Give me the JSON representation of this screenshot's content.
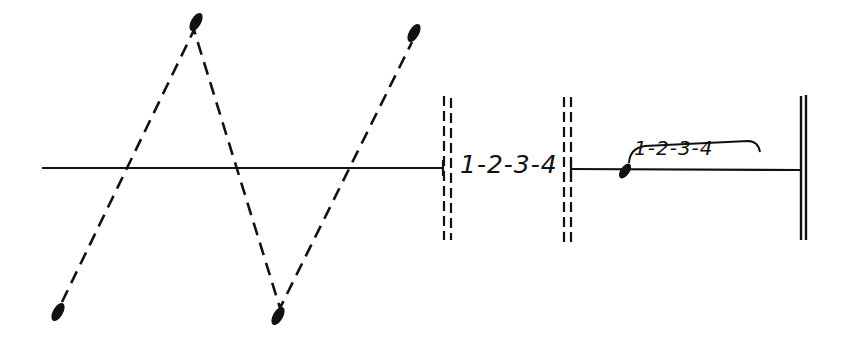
{
  "diagram": {
    "type": "graphic music notation",
    "ink_color": "#111111",
    "background": "#ffffff",
    "staff_line": {
      "y": 168
    },
    "zigzag_notes": [
      {
        "x": 58,
        "y": 310
      },
      {
        "x": 196,
        "y": 24
      },
      {
        "x": 278,
        "y": 315
      },
      {
        "x": 414,
        "y": 35
      }
    ],
    "barlines": [
      {
        "kind": "dashed-double",
        "x": 443
      },
      {
        "kind": "dashed-double",
        "x": 564
      },
      {
        "kind": "final-double",
        "x": 801
      }
    ],
    "section_count_label": "1-2-3-4",
    "final_note": {
      "x": 625,
      "y": 171
    },
    "slurred_count_label": "1-2-3-4"
  }
}
